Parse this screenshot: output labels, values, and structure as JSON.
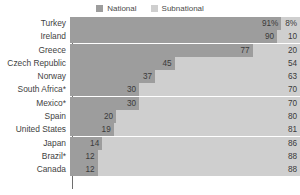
{
  "legend": {
    "position": "top-center",
    "items": [
      {
        "label": "National",
        "color": "#9d9d9d",
        "key": "national"
      },
      {
        "label": "Subnational",
        "color": "#cfcfcf",
        "key": "subnational"
      }
    ]
  },
  "chart_data": {
    "type": "bar",
    "orientation": "horizontal",
    "stacked": true,
    "normalized_to_percent": true,
    "title": "",
    "subtitle": "",
    "xlabel": "",
    "ylabel": "",
    "xlim": [
      0,
      100
    ],
    "grid": false,
    "legend_position": "top-center",
    "categories": [
      "Turkey",
      "Ireland",
      "Greece",
      "Czech Republic",
      "Norway",
      "South Africa*",
      "Mexico*",
      "Spain",
      "United States",
      "Japan",
      "Brazil*",
      "Canada"
    ],
    "series": [
      {
        "name": "National",
        "color": "#9d9d9d",
        "values": [
          91,
          90,
          77,
          45,
          37,
          30,
          30,
          20,
          19,
          14,
          12,
          12
        ],
        "labels": [
          "91%",
          "90",
          "77",
          "45",
          "37",
          "30",
          "30",
          "20",
          "19",
          "14",
          "12",
          "12"
        ]
      },
      {
        "name": "Subnational",
        "color": "#cfcfcf",
        "values": [
          8,
          10,
          20,
          54,
          63,
          70,
          70,
          80,
          81,
          86,
          88,
          88
        ],
        "labels": [
          "8%",
          "10",
          "20",
          "54",
          "63",
          "70",
          "70",
          "80",
          "81",
          "86",
          "88",
          "88"
        ]
      }
    ]
  },
  "rows": [
    {
      "category": "Turkey",
      "national": 91,
      "subnational": 8,
      "national_label": "91%",
      "subnational_label": "8%"
    },
    {
      "category": "Ireland",
      "national": 90,
      "subnational": 10,
      "national_label": "90",
      "subnational_label": "10"
    },
    {
      "category": "Greece",
      "national": 77,
      "subnational": 20,
      "national_label": "77",
      "subnational_label": "20"
    },
    {
      "category": "Czech Republic",
      "national": 45,
      "subnational": 54,
      "national_label": "45",
      "subnational_label": "54"
    },
    {
      "category": "Norway",
      "national": 37,
      "subnational": 63,
      "national_label": "37",
      "subnational_label": "63"
    },
    {
      "category": "South Africa*",
      "national": 30,
      "subnational": 70,
      "national_label": "30",
      "subnational_label": "70"
    },
    {
      "category": "Mexico*",
      "national": 30,
      "subnational": 70,
      "national_label": "30",
      "subnational_label": "70"
    },
    {
      "category": "Spain",
      "national": 20,
      "subnational": 80,
      "national_label": "20",
      "subnational_label": "80"
    },
    {
      "category": "United States",
      "national": 19,
      "subnational": 81,
      "national_label": "19",
      "subnational_label": "81"
    },
    {
      "category": "Japan",
      "national": 14,
      "subnational": 86,
      "national_label": "14",
      "subnational_label": "86"
    },
    {
      "category": "Brazil*",
      "national": 12,
      "subnational": 88,
      "national_label": "12",
      "subnational_label": "88"
    },
    {
      "category": "Canada",
      "national": 12,
      "subnational": 88,
      "national_label": "12",
      "subnational_label": "88"
    }
  ]
}
